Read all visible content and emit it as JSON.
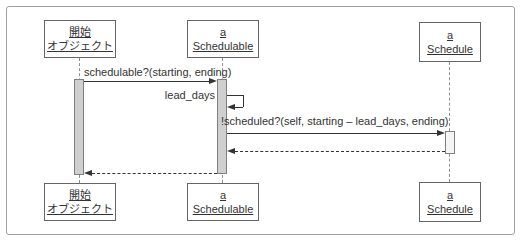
{
  "diagram": {
    "kind": "uml-sequence-diagram"
  },
  "colors": {
    "frame_border": "#a0a0a0",
    "box_border": "#666666",
    "box_fill": "#ffffff",
    "text": "#333333",
    "lifeline": "#909090",
    "activation_fill": "#cfcfcf",
    "activation_border": "#808080",
    "activation_fill_light": "#f5f5f5",
    "arrow": "#333333"
  },
  "lifelines": [
    {
      "id": "initiator",
      "line1": "開始",
      "line2": "オブジェクト"
    },
    {
      "id": "schedulable",
      "line1": "a",
      "line2": "Schedulable"
    },
    {
      "id": "schedule",
      "line1": "a",
      "line2": "Schedule"
    }
  ],
  "messages": [
    {
      "label": "schedulable?(starting, ending)",
      "kind": "call",
      "from": "initiator",
      "to": "schedulable"
    },
    {
      "label": "lead_days",
      "kind": "self-call",
      "from": "schedulable",
      "to": "schedulable"
    },
    {
      "label": "!scheduled?(self, starting – lead_days, ending)",
      "kind": "call",
      "from": "schedulable",
      "to": "schedule"
    },
    {
      "label": "",
      "kind": "return",
      "from": "schedule",
      "to": "schedulable"
    },
    {
      "label": "",
      "kind": "return",
      "from": "schedulable",
      "to": "initiator"
    }
  ]
}
